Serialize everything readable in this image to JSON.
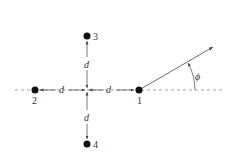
{
  "diagram": {
    "type": "antenna-array-geometry",
    "elements": [
      {
        "id": "1",
        "label": "1",
        "x": 139,
        "y": 90
      },
      {
        "id": "2",
        "label": "2",
        "x": 35,
        "y": 90
      },
      {
        "id": "3",
        "label": "3",
        "x": 87,
        "y": 36
      },
      {
        "id": "4",
        "label": "4",
        "x": 87,
        "y": 144
      }
    ],
    "center": {
      "x": 87,
      "y": 90
    },
    "spacing_label": "d",
    "angle_label": "ϕ",
    "colors": {
      "line": "#555555",
      "dot": "#111111",
      "text": "#333333"
    }
  }
}
